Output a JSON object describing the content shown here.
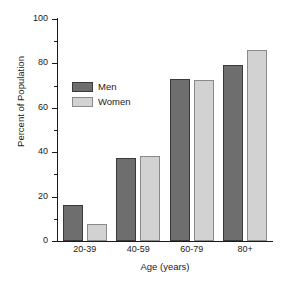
{
  "chart_data": {
    "type": "bar",
    "title": "",
    "xlabel": "Age (years)",
    "ylabel": "Percent of Population",
    "categories": [
      "20-39",
      "40-59",
      "60-79",
      "80+"
    ],
    "series": [
      {
        "name": "Men",
        "color": "#6e6e6e",
        "values": [
          16.2,
          37.6,
          73.0,
          79.2
        ]
      },
      {
        "name": "Women",
        "color": "#d2d2d2",
        "values": [
          7.6,
          38.2,
          72.6,
          86.0
        ]
      }
    ],
    "ylim": [
      0,
      100
    ],
    "yticks": [
      0,
      20,
      40,
      60,
      80,
      100
    ],
    "ytick_labels": [
      "0",
      "20",
      "40",
      "60",
      "80",
      "100"
    ],
    "yminor_ticks": [
      10,
      30,
      50,
      70,
      90
    ],
    "grid": false,
    "legend_position": "upper-left-inside"
  },
  "legend": {
    "entries": [
      {
        "label": "Men"
      },
      {
        "label": "Women"
      }
    ]
  },
  "axes": {
    "y_title": "Percent of Population",
    "x_title": "Age (years)",
    "y_labels": [
      "100",
      "80",
      "60",
      "40",
      "20",
      "0"
    ],
    "x_labels": [
      "20-39",
      "40-59",
      "60-79",
      "80+"
    ]
  }
}
